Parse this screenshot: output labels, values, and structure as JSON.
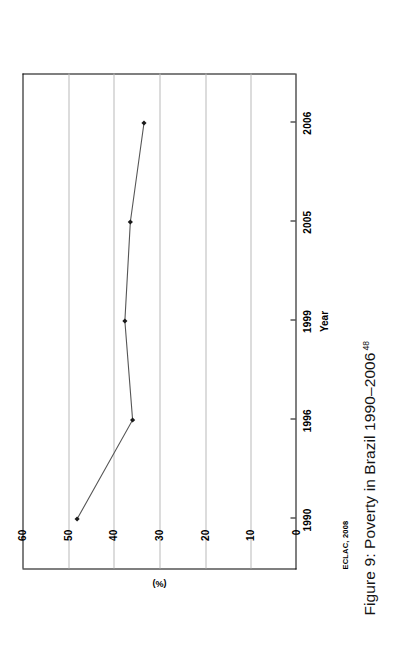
{
  "figure": {
    "caption_text": "Figure 9: Poverty in Brazil 1990–2006",
    "caption_footnote": "48",
    "source_note": "ECLAC, 2008"
  },
  "chart_data": {
    "type": "line",
    "title": "",
    "xlabel": "Year",
    "ylabel": "(%)",
    "categories": [
      "1990",
      "1996",
      "1999",
      "2005",
      "2006"
    ],
    "values": [
      48.0,
      35.8,
      37.5,
      36.3,
      33.3
    ],
    "series": [
      {
        "name": "Poverty rate",
        "values": [
          48.0,
          35.8,
          37.5,
          36.3,
          33.3
        ]
      }
    ],
    "ylim": [
      0,
      60
    ],
    "yticks": [
      "0",
      "10",
      "20",
      "30",
      "40",
      "50",
      "60"
    ],
    "ytick_values": [
      0,
      10,
      20,
      30,
      40,
      50,
      60
    ],
    "xticks": [
      "1990",
      "1996",
      "1999",
      "2005",
      "2006"
    ],
    "grid": "horizontal-gridlines-at-yticks",
    "legend": "none",
    "marker": "diamond",
    "line_color": "#555555",
    "marker_color": "#1a1a1a",
    "gridline_color": "#b9b9b9",
    "axis_color": "#000000",
    "orientation": "page rotated 90 degrees counter-clockwise"
  }
}
